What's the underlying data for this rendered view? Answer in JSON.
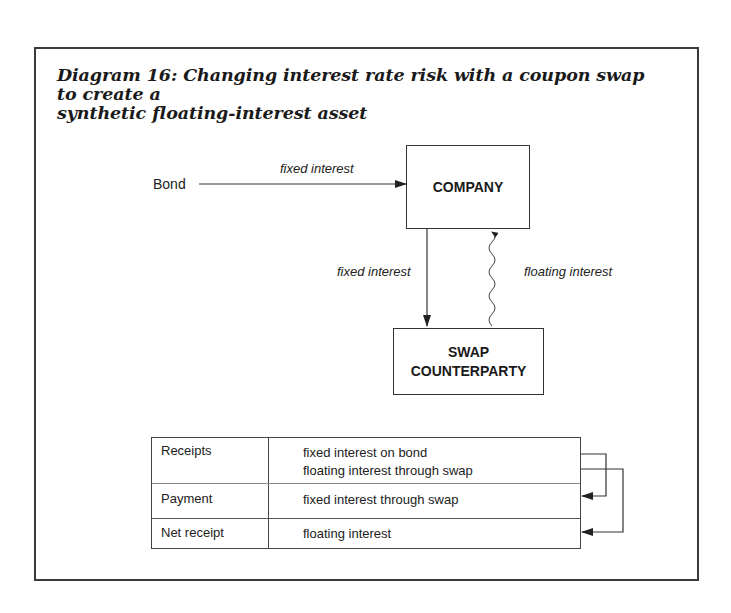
{
  "title": {
    "line1": "Diagram 16: Changing interest rate risk with a coupon swap to create a",
    "line2": "synthetic floating-interest asset"
  },
  "diagram": {
    "source_label": "Bond",
    "bond_to_company_label": "fixed interest",
    "company_label": "COMPANY",
    "company_to_swap_label": "fixed interest",
    "swap_to_company_label": "floating interest",
    "swap_label_line1": "SWAP",
    "swap_label_line2": "COUNTERPARTY"
  },
  "table": {
    "rows": [
      {
        "label": "Receipts",
        "values": [
          "fixed interest on bond",
          "floating interest through swap"
        ]
      },
      {
        "label": "Payment",
        "values": [
          "fixed interest through swap"
        ]
      },
      {
        "label": "Net receipt",
        "values": [
          "floating interest"
        ]
      }
    ]
  },
  "colors": {
    "line": "#333333",
    "text": "#222222"
  }
}
